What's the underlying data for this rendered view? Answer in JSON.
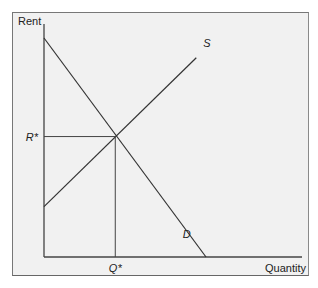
{
  "chart_data": {
    "type": "line",
    "title": "",
    "xlabel": "Quantity",
    "ylabel": "Rent",
    "xlim": [
      0,
      100
    ],
    "ylim": [
      0,
      100
    ],
    "grid": false,
    "series": [
      {
        "name": "D",
        "label": "D",
        "points": [
          [
            0,
            100
          ],
          [
            100,
            0
          ]
        ]
      },
      {
        "name": "S",
        "label": "S",
        "points": [
          [
            0,
            23
          ],
          [
            94,
            91
          ]
        ]
      }
    ],
    "equilibrium": {
      "x": 44,
      "y": 55,
      "x_label": "Q*",
      "y_label": "R*"
    },
    "series_label_positions": {
      "D": [
        93,
        5
      ],
      "S": [
        97,
        95
      ]
    }
  },
  "labels": {
    "y_axis": "Rent",
    "x_axis": "Quantity",
    "r_star": "R*",
    "q_star": "Q*",
    "supply": "S",
    "demand": "D"
  }
}
